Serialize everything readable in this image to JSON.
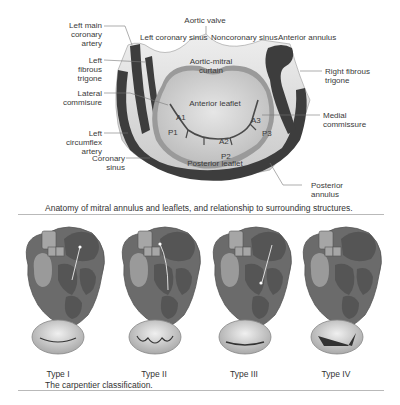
{
  "figure_top": {
    "labels": {
      "aortic_valve": "Aortic valve",
      "left_coronary_sinus": "Left coronary sinus",
      "noncoronary_sinus": "Noncoronary sinus",
      "anterior_annulus": "Anterior annulus",
      "left_main_coronary_artery_1": "Left main",
      "left_main_coronary_artery_2": "coronary",
      "left_main_coronary_artery_3": "artery",
      "left_fibrous_trigone_1": "Left",
      "left_fibrous_trigone_2": "fibrous",
      "left_fibrous_trigone_3": "trigone",
      "lateral_commisure_1": "Lateral",
      "lateral_commisure_2": "commisure",
      "left_circumflex_artery_1": "Left",
      "left_circumflex_artery_2": "circumflex",
      "left_circumflex_artery_3": "artery",
      "coronary_sinus_1": "Coronary",
      "coronary_sinus_2": "sinus",
      "aortic_mitral_curtain_1": "Aortic-mitral",
      "aortic_mitral_curtain_2": "curtain",
      "right_fibrous_trigone_1": "Right fibrous",
      "right_fibrous_trigone_2": "trigone",
      "anterior_leaflet": "Anterior leaflet",
      "posterior_leaflet": "Posterior leaflet",
      "medial_commissure_1": "Medial",
      "medial_commissure_2": "commissure",
      "posterior_annulus_1": "Posterior",
      "posterior_annulus_2": "annulus",
      "a1": "A1",
      "a2": "A2",
      "a3": "A3",
      "p1": "P1",
      "p2": "P2",
      "p3": "P3"
    },
    "caption": "Anatomy of mitral annulus and leaflets, and relationship to surrounding structures."
  },
  "figure_bottom": {
    "types": [
      {
        "label": "Type I"
      },
      {
        "label": "Type II"
      },
      {
        "label": "Type III"
      },
      {
        "label": "Type IV"
      }
    ],
    "caption": "The carpentier classification."
  },
  "colors": {
    "dark": "#3d3d3d",
    "mid": "#8a8a8a",
    "light": "#d9d9d9",
    "rule": "#b9b9b9"
  }
}
